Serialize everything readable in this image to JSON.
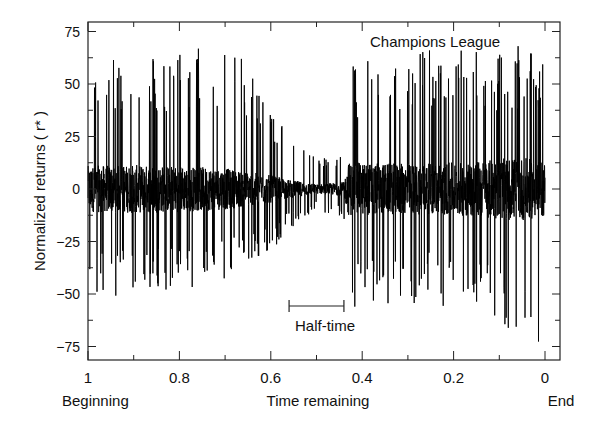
{
  "chart_data": {
    "type": "line",
    "title": "",
    "annotation_title": "Champions League",
    "xlabel": "Time remaining",
    "ylabel": "Normalized returns ( r* )",
    "x_start_label": "Beginning",
    "x_end_label": "End",
    "xlim": [
      1,
      0
    ],
    "ylim": [
      -80,
      80
    ],
    "x_ticks": [
      "1",
      "0.8",
      "0.6",
      "0.4",
      "0.2",
      "0"
    ],
    "x_tick_values": [
      1,
      0.8,
      0.6,
      0.4,
      0.2,
      0
    ],
    "y_ticks": [
      "75",
      "50",
      "25",
      "0",
      "-25",
      "-50",
      "-75"
    ],
    "y_tick_values": [
      75,
      50,
      25,
      0,
      -25,
      -50,
      -75
    ],
    "grid": false,
    "halftime_annotation": {
      "label": "Half-time",
      "x_from": 0.56,
      "x_to": 0.44
    },
    "series": [
      {
        "name": "Normalized returns",
        "color": "#000000",
        "description": "Dense high-frequency return series; approximate amplitude envelope by time remaining",
        "envelope": [
          {
            "x": 1.0,
            "max": 60,
            "min": -50
          },
          {
            "x": 0.9,
            "max": 63,
            "min": -52
          },
          {
            "x": 0.8,
            "max": 66,
            "min": -50
          },
          {
            "x": 0.7,
            "max": 72,
            "min": -45
          },
          {
            "x": 0.6,
            "max": 45,
            "min": -30
          },
          {
            "x": 0.56,
            "max": 25,
            "min": -20
          },
          {
            "x": 0.5,
            "max": 15,
            "min": -10
          },
          {
            "x": 0.44,
            "max": 20,
            "min": -15
          },
          {
            "x": 0.43,
            "max": 60,
            "min": -58
          },
          {
            "x": 0.35,
            "max": 65,
            "min": -55
          },
          {
            "x": 0.25,
            "max": 70,
            "min": -55
          },
          {
            "x": 0.15,
            "max": 68,
            "min": -60
          },
          {
            "x": 0.05,
            "max": 68,
            "min": -70
          },
          {
            "x": 0.0,
            "max": 60,
            "min": -75
          }
        ]
      }
    ]
  }
}
